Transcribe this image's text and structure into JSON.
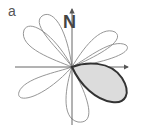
{
  "panel": {
    "label": "a"
  },
  "axes": {
    "north_label": "N",
    "origin": [
      72,
      67
    ],
    "x_axis": {
      "from": [
        15,
        67
      ],
      "to": [
        128,
        67
      ],
      "arrow": true
    },
    "y_axis": {
      "from": [
        72,
        125
      ],
      "to": [
        72,
        9
      ],
      "arrow": true
    }
  },
  "lobes": [
    {
      "name": "upper-left-lobe-a",
      "tip": [
        45,
        15
      ],
      "filled": false
    },
    {
      "name": "upper-left-lobe-b",
      "tip": [
        25,
        30
      ],
      "filled": false
    },
    {
      "name": "upper-right-lobe-1",
      "tip": [
        115,
        35
      ],
      "filled": false
    },
    {
      "name": "upper-right-lobe-2",
      "tip": [
        128,
        50
      ],
      "filled": false
    },
    {
      "name": "lower-left-lobe",
      "tip": [
        20,
        95
      ],
      "filled": false
    },
    {
      "name": "lower-lobe",
      "tip": [
        83,
        122
      ],
      "filled": false
    },
    {
      "name": "highlighted-lobe",
      "tip": [
        126,
        100
      ],
      "filled": true
    }
  ],
  "colors": {
    "outline": "#8a8a8a",
    "axis": "#555555",
    "highlight_stroke": "#333333",
    "highlight_fill": "#dcdcdc",
    "text": "#444444"
  }
}
